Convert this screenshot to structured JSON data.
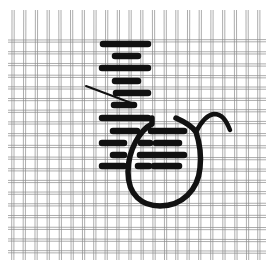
{
  "figure": {
    "title": "Needlepoint stitch illustration",
    "colors": {
      "background": "#ffffff",
      "mesh": "#8a8a8a",
      "thread": "#111111"
    }
  },
  "canvas": {
    "x0": 12,
    "y0": 12,
    "x1": 262,
    "y1": 258,
    "spacing": 11.7,
    "double_gap": 2.2
  },
  "stitches": [
    {
      "x1": 103,
      "x2": 148,
      "y": 44
    },
    {
      "x1": 115,
      "x2": 138,
      "y": 56
    },
    {
      "x1": 102,
      "x2": 148,
      "y": 68
    },
    {
      "x1": 115,
      "x2": 138,
      "y": 81
    },
    {
      "x1": 116,
      "x2": 148,
      "y": 93
    },
    {
      "x1": 114,
      "x2": 134,
      "y": 105
    },
    {
      "x1": 102,
      "x2": 148,
      "y": 118
    },
    {
      "x1": 113,
      "x2": 137,
      "y": 131
    },
    {
      "x1": 151,
      "x2": 184,
      "y": 131
    },
    {
      "x1": 102,
      "x2": 124,
      "y": 143
    },
    {
      "x1": 141,
      "x2": 150,
      "y": 143
    },
    {
      "x1": 156,
      "x2": 179,
      "y": 143
    },
    {
      "x1": 113,
      "x2": 124,
      "y": 155
    },
    {
      "x1": 140,
      "x2": 184,
      "y": 155
    },
    {
      "x1": 102,
      "x2": 124,
      "y": 166
    },
    {
      "x1": 138,
      "x2": 149,
      "y": 166
    },
    {
      "x1": 154,
      "x2": 179,
      "y": 166
    }
  ],
  "needle": {
    "x1": 86,
    "y1": 86,
    "x2": 134,
    "y2": 104
  },
  "thread_loop": {
    "path": "M152,118 L152,124 C140,130 128,150 128,172 C128,195 142,206 160,206 C182,206 198,190 200,168 C202,150 198,138 196,132 C192,126 185,122 176,118",
    "tail": "M196,132 C200,124 206,115 214,114 C222,114 226,120 230,130"
  }
}
